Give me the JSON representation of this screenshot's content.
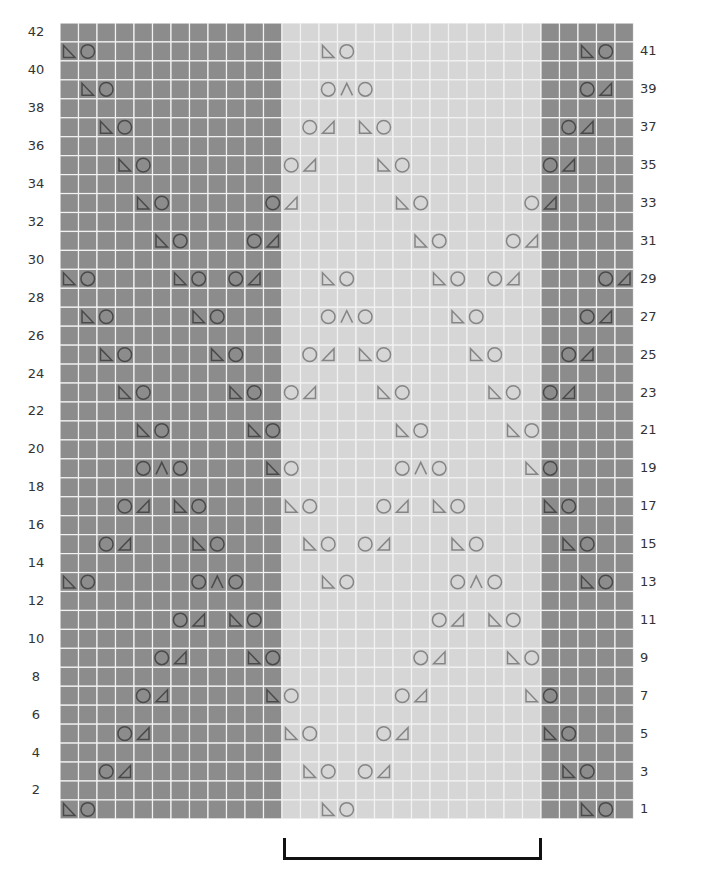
{
  "chart": {
    "type": "knitting-lace-chart",
    "columns": 31,
    "rows": 42,
    "cell_width": 18.5,
    "cell_height": 18.95,
    "sections": [
      {
        "name": "left-panel",
        "start_col": 0,
        "end_col": 11,
        "shade": "dark"
      },
      {
        "name": "center-repeat",
        "start_col": 12,
        "end_col": 25,
        "shade": "light"
      },
      {
        "name": "right-panel",
        "start_col": 26,
        "end_col": 30,
        "shade": "dark"
      }
    ],
    "colors": {
      "dark_cell": "#8c8c8c",
      "light_cell": "#d6d6d6",
      "gridline": "#f2f2f2",
      "symbol_on_dark": "#4a4a4a",
      "symbol_on_light": "#858585",
      "bracket": "#111111"
    },
    "symbol_legend": {
      "ssk": "left-slanting decrease (triangle, vertical edge left)",
      "k2tog": "right-slanting decrease (triangle, vertical edge right)",
      "yo": "yarn over (circle)",
      "s2kp": "centered double decrease (caret)"
    },
    "left_labels": [
      "42",
      "40",
      "38",
      "36",
      "34",
      "32",
      "30",
      "28",
      "26",
      "24",
      "22",
      "20",
      "18",
      "16",
      "14",
      "12",
      "10",
      "8",
      "6",
      "4",
      "2"
    ],
    "right_labels": [
      "41",
      "39",
      "37",
      "35",
      "33",
      "31",
      "29",
      "27",
      "25",
      "23",
      "21",
      "19",
      "17",
      "15",
      "13",
      "11",
      "9",
      "7",
      "5",
      "3",
      "1"
    ],
    "pattern_rows": [
      {
        "row": 41,
        "stitches": [
          [
            0,
            "ssk"
          ],
          [
            1,
            "yo"
          ],
          [
            14,
            "ssk"
          ],
          [
            15,
            "yo"
          ],
          [
            28,
            "ssk"
          ],
          [
            29,
            "yo"
          ]
        ]
      },
      {
        "row": 39,
        "stitches": [
          [
            1,
            "ssk"
          ],
          [
            2,
            "yo"
          ],
          [
            14,
            "yo"
          ],
          [
            15,
            "s2kp"
          ],
          [
            16,
            "yo"
          ],
          [
            28,
            "yo"
          ],
          [
            29,
            "k2tog"
          ]
        ]
      },
      {
        "row": 37,
        "stitches": [
          [
            2,
            "ssk"
          ],
          [
            3,
            "yo"
          ],
          [
            13,
            "yo"
          ],
          [
            14,
            "k2tog"
          ],
          [
            16,
            "ssk"
          ],
          [
            17,
            "yo"
          ],
          [
            27,
            "yo"
          ],
          [
            28,
            "k2tog"
          ]
        ]
      },
      {
        "row": 35,
        "stitches": [
          [
            3,
            "ssk"
          ],
          [
            4,
            "yo"
          ],
          [
            12,
            "yo"
          ],
          [
            13,
            "k2tog"
          ],
          [
            17,
            "ssk"
          ],
          [
            18,
            "yo"
          ],
          [
            26,
            "yo"
          ],
          [
            27,
            "k2tog"
          ]
        ]
      },
      {
        "row": 33,
        "stitches": [
          [
            4,
            "ssk"
          ],
          [
            5,
            "yo"
          ],
          [
            11,
            "yo"
          ],
          [
            12,
            "k2tog"
          ],
          [
            18,
            "ssk"
          ],
          [
            19,
            "yo"
          ],
          [
            25,
            "yo"
          ],
          [
            26,
            "k2tog"
          ]
        ]
      },
      {
        "row": 31,
        "stitches": [
          [
            5,
            "ssk"
          ],
          [
            6,
            "yo"
          ],
          [
            10,
            "yo"
          ],
          [
            11,
            "k2tog"
          ],
          [
            19,
            "ssk"
          ],
          [
            20,
            "yo"
          ],
          [
            24,
            "yo"
          ],
          [
            25,
            "k2tog"
          ]
        ]
      },
      {
        "row": 29,
        "stitches": [
          [
            0,
            "ssk"
          ],
          [
            1,
            "yo"
          ],
          [
            6,
            "ssk"
          ],
          [
            7,
            "yo"
          ],
          [
            9,
            "yo"
          ],
          [
            10,
            "k2tog"
          ],
          [
            14,
            "ssk"
          ],
          [
            15,
            "yo"
          ],
          [
            20,
            "ssk"
          ],
          [
            21,
            "yo"
          ],
          [
            23,
            "yo"
          ],
          [
            24,
            "k2tog"
          ],
          [
            29,
            "yo"
          ],
          [
            30,
            "k2tog"
          ]
        ]
      },
      {
        "row": 27,
        "stitches": [
          [
            1,
            "ssk"
          ],
          [
            2,
            "yo"
          ],
          [
            7,
            "ssk"
          ],
          [
            8,
            "yo"
          ],
          [
            14,
            "yo"
          ],
          [
            15,
            "s2kp"
          ],
          [
            16,
            "yo"
          ],
          [
            21,
            "ssk"
          ],
          [
            22,
            "yo"
          ],
          [
            28,
            "yo"
          ],
          [
            29,
            "k2tog"
          ]
        ]
      },
      {
        "row": 25,
        "stitches": [
          [
            2,
            "ssk"
          ],
          [
            3,
            "yo"
          ],
          [
            8,
            "ssk"
          ],
          [
            9,
            "yo"
          ],
          [
            13,
            "yo"
          ],
          [
            14,
            "k2tog"
          ],
          [
            16,
            "ssk"
          ],
          [
            17,
            "yo"
          ],
          [
            22,
            "ssk"
          ],
          [
            23,
            "yo"
          ],
          [
            27,
            "yo"
          ],
          [
            28,
            "k2tog"
          ]
        ]
      },
      {
        "row": 23,
        "stitches": [
          [
            3,
            "ssk"
          ],
          [
            4,
            "yo"
          ],
          [
            9,
            "ssk"
          ],
          [
            10,
            "yo"
          ],
          [
            12,
            "yo"
          ],
          [
            13,
            "k2tog"
          ],
          [
            17,
            "ssk"
          ],
          [
            18,
            "yo"
          ],
          [
            23,
            "ssk"
          ],
          [
            24,
            "yo"
          ],
          [
            26,
            "yo"
          ],
          [
            27,
            "k2tog"
          ]
        ]
      },
      {
        "row": 21,
        "stitches": [
          [
            4,
            "ssk"
          ],
          [
            5,
            "yo"
          ],
          [
            10,
            "ssk"
          ],
          [
            11,
            "yo"
          ],
          [
            18,
            "ssk"
          ],
          [
            19,
            "yo"
          ],
          [
            24,
            "ssk"
          ],
          [
            25,
            "yo"
          ]
        ]
      },
      {
        "row": 19,
        "stitches": [
          [
            4,
            "yo"
          ],
          [
            5,
            "s2kp"
          ],
          [
            6,
            "yo"
          ],
          [
            11,
            "ssk"
          ],
          [
            12,
            "yo"
          ],
          [
            18,
            "yo"
          ],
          [
            19,
            "s2kp"
          ],
          [
            20,
            "yo"
          ],
          [
            25,
            "ssk"
          ],
          [
            26,
            "yo"
          ]
        ]
      },
      {
        "row": 17,
        "stitches": [
          [
            3,
            "yo"
          ],
          [
            4,
            "k2tog"
          ],
          [
            6,
            "ssk"
          ],
          [
            7,
            "yo"
          ],
          [
            12,
            "ssk"
          ],
          [
            13,
            "yo"
          ],
          [
            17,
            "yo"
          ],
          [
            18,
            "k2tog"
          ],
          [
            20,
            "ssk"
          ],
          [
            21,
            "yo"
          ],
          [
            26,
            "ssk"
          ],
          [
            27,
            "yo"
          ]
        ]
      },
      {
        "row": 15,
        "stitches": [
          [
            2,
            "yo"
          ],
          [
            3,
            "k2tog"
          ],
          [
            7,
            "ssk"
          ],
          [
            8,
            "yo"
          ],
          [
            13,
            "ssk"
          ],
          [
            14,
            "yo"
          ],
          [
            16,
            "yo"
          ],
          [
            17,
            "k2tog"
          ],
          [
            21,
            "ssk"
          ],
          [
            22,
            "yo"
          ],
          [
            27,
            "ssk"
          ],
          [
            28,
            "yo"
          ]
        ]
      },
      {
        "row": 13,
        "stitches": [
          [
            0,
            "ssk"
          ],
          [
            1,
            "yo"
          ],
          [
            7,
            "yo"
          ],
          [
            8,
            "s2kp"
          ],
          [
            9,
            "yo"
          ],
          [
            14,
            "ssk"
          ],
          [
            15,
            "yo"
          ],
          [
            21,
            "yo"
          ],
          [
            22,
            "s2kp"
          ],
          [
            23,
            "yo"
          ],
          [
            28,
            "ssk"
          ],
          [
            29,
            "yo"
          ]
        ]
      },
      {
        "row": 11,
        "stitches": [
          [
            6,
            "yo"
          ],
          [
            7,
            "k2tog"
          ],
          [
            9,
            "ssk"
          ],
          [
            10,
            "yo"
          ],
          [
            20,
            "yo"
          ],
          [
            21,
            "k2tog"
          ],
          [
            23,
            "ssk"
          ],
          [
            24,
            "yo"
          ]
        ]
      },
      {
        "row": 9,
        "stitches": [
          [
            5,
            "yo"
          ],
          [
            6,
            "k2tog"
          ],
          [
            10,
            "ssk"
          ],
          [
            11,
            "yo"
          ],
          [
            19,
            "yo"
          ],
          [
            20,
            "k2tog"
          ],
          [
            24,
            "ssk"
          ],
          [
            25,
            "yo"
          ]
        ]
      },
      {
        "row": 7,
        "stitches": [
          [
            4,
            "yo"
          ],
          [
            5,
            "k2tog"
          ],
          [
            11,
            "ssk"
          ],
          [
            12,
            "yo"
          ],
          [
            18,
            "yo"
          ],
          [
            19,
            "k2tog"
          ],
          [
            25,
            "ssk"
          ],
          [
            26,
            "yo"
          ]
        ]
      },
      {
        "row": 5,
        "stitches": [
          [
            3,
            "yo"
          ],
          [
            4,
            "k2tog"
          ],
          [
            12,
            "ssk"
          ],
          [
            13,
            "yo"
          ],
          [
            17,
            "yo"
          ],
          [
            18,
            "k2tog"
          ],
          [
            26,
            "ssk"
          ],
          [
            27,
            "yo"
          ]
        ]
      },
      {
        "row": 3,
        "stitches": [
          [
            2,
            "yo"
          ],
          [
            3,
            "k2tog"
          ],
          [
            13,
            "ssk"
          ],
          [
            14,
            "yo"
          ],
          [
            16,
            "yo"
          ],
          [
            17,
            "k2tog"
          ],
          [
            27,
            "ssk"
          ],
          [
            28,
            "yo"
          ]
        ]
      },
      {
        "row": 1,
        "stitches": [
          [
            0,
            "ssk"
          ],
          [
            1,
            "yo"
          ],
          [
            14,
            "ssk"
          ],
          [
            15,
            "yo"
          ],
          [
            28,
            "ssk"
          ],
          [
            29,
            "yo"
          ]
        ]
      }
    ],
    "repeat_bracket": {
      "start_col": 12,
      "end_col": 25
    }
  }
}
